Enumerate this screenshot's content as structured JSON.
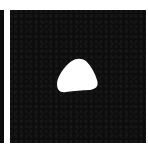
{
  "image": {
    "description": "Binary segmentation mask panel: black background with a single white rounded-triangular region near center",
    "colors": {
      "background": "#ffffff",
      "panel": "#0d0d0d",
      "mask": "#ffffff"
    },
    "panels": [
      {
        "name": "left-partial-panel",
        "visible": "cropped edge"
      },
      {
        "name": "mask-panel",
        "region": "white blob"
      }
    ]
  }
}
